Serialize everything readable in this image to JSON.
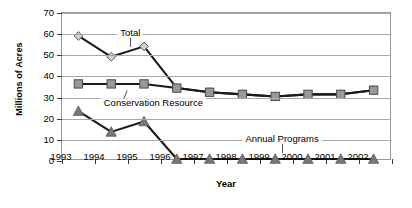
{
  "chart_data": {
    "type": "line",
    "title": "",
    "xlabel": "Year",
    "ylabel": "Millions of Acres",
    "categories": [
      "1993",
      "1994",
      "1995",
      "1996",
      "1997",
      "1998",
      "1999",
      "2000",
      "2001",
      "2002"
    ],
    "ylim": [
      0,
      70
    ],
    "ytick_step": 10,
    "yticks": [
      "0",
      "10",
      "20",
      "30",
      "40",
      "50",
      "60",
      "70"
    ],
    "grid": true,
    "legend_position": "inline-annotations",
    "series": [
      {
        "name": "Total",
        "marker": "diamond",
        "color": "#d0d0d0",
        "values": [
          59,
          49,
          54,
          34,
          32,
          31,
          30,
          31,
          31,
          33
        ]
      },
      {
        "name": "Conservation Resource",
        "marker": "square",
        "color": "#999999",
        "values": [
          36,
          36,
          36,
          34,
          32,
          31,
          30,
          31,
          31,
          33
        ]
      },
      {
        "name": "Annual Programs",
        "marker": "triangle",
        "color": "#777777",
        "values": [
          23,
          13,
          18,
          0,
          0,
          0,
          0,
          0,
          0,
          0
        ]
      }
    ],
    "annotations": [
      {
        "text": "Total",
        "x": 1994.6,
        "y": 60
      },
      {
        "text": "Conservation Resource",
        "x": 1995.3,
        "y": 27
      },
      {
        "text": "Annual Programs",
        "x": 1999.2,
        "y": 10
      }
    ]
  }
}
